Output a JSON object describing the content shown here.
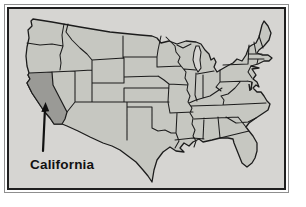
{
  "map": {
    "country": "United States",
    "type": "state-outline-map",
    "highlighted_state": "California",
    "label": "California"
  },
  "colors": {
    "page-bg": "#ffffff",
    "panel-bg": "#d6d5d2",
    "state-fill": "#c6c7c1",
    "highlight-fill": "#9a9a96",
    "border-stroke": "#1c1c1c",
    "frame-outer": "#8f8f8f",
    "frame-inner": "#1f1f1f",
    "label-color": "#111111"
  }
}
